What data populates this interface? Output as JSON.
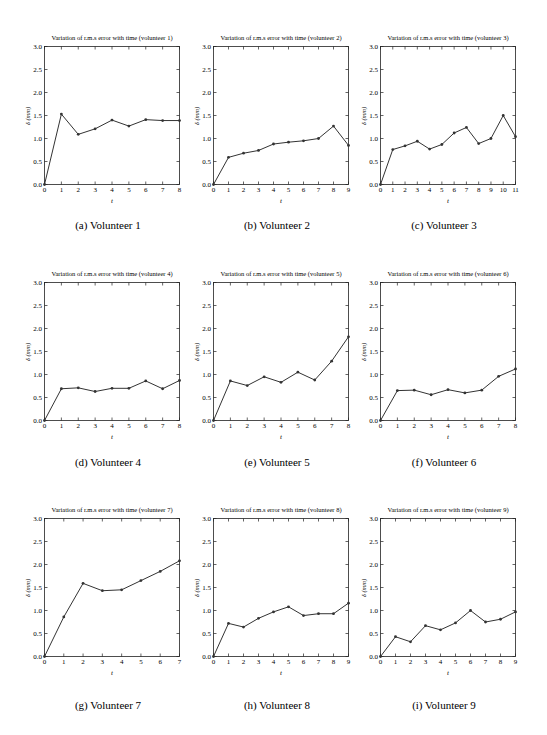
{
  "figure": {
    "panels": [
      {
        "title": "Variation of r.m.s error with time (volunteer 1)",
        "caption": "(a) Volunteer 1",
        "xlabel": "t",
        "ylabel": "δ (mm)"
      },
      {
        "title": "Variation of r.m.s error with time (volunteer 2)",
        "caption": "(b) Volunteer 2",
        "xlabel": "t",
        "ylabel": "δ (mm)"
      },
      {
        "title": "Variation of r.m.s error with time (volunteer 3)",
        "caption": "(c) Volunteer 3",
        "xlabel": "t",
        "ylabel": "δ (mm)"
      },
      {
        "title": "Variation of r.m.s error with time (volunteer 4)",
        "caption": "(d) Volunteer 4",
        "xlabel": "t",
        "ylabel": "δ (mm)"
      },
      {
        "title": "Variation of r.m.s error with time (volunteer 5)",
        "caption": "(e) Volunteer 5",
        "xlabel": "t",
        "ylabel": "δ (mm)"
      },
      {
        "title": "Variation of r.m.s error with time (volunteer 6)",
        "caption": "(f) Volunteer 6",
        "xlabel": "t",
        "ylabel": "δ (mm)"
      },
      {
        "title": "Variation of r.m.s error with time (volunteer 7)",
        "caption": "(g) Volunteer 7",
        "xlabel": "t",
        "ylabel": "δ (mm)"
      },
      {
        "title": "Variation of r.m.s error with time (volunteer 8)",
        "caption": "(h) Volunteer 8",
        "xlabel": "t",
        "ylabel": "δ (mm)"
      },
      {
        "title": "Variation of r.m.s error with time (volunteer 9)",
        "caption": "(i) Volunteer 9",
        "xlabel": "t",
        "ylabel": "δ (mm)"
      }
    ],
    "yticks": [
      "0.0",
      "0.5",
      "1.0",
      "1.5",
      "2.0",
      "2.5",
      "3.0"
    ],
    "line_color": "#333333"
  },
  "chart_data": [
    {
      "type": "line",
      "title": "Variation of r.m.s error with time (volunteer 1)",
      "xlabel": "t",
      "ylabel": "δ (mm)",
      "ylim": [
        0,
        3
      ],
      "xlim": [
        0,
        8
      ],
      "grid": false,
      "x": [
        0,
        1,
        2,
        3,
        4,
        5,
        6,
        7,
        8
      ],
      "values": [
        0.0,
        1.53,
        1.09,
        1.21,
        1.4,
        1.27,
        1.41,
        1.39,
        1.39
      ]
    },
    {
      "type": "line",
      "title": "Variation of r.m.s error with time (volunteer 2)",
      "xlabel": "t",
      "ylabel": "δ (mm)",
      "ylim": [
        0,
        3
      ],
      "xlim": [
        0,
        9
      ],
      "grid": false,
      "x": [
        0,
        1,
        2,
        3,
        4,
        5,
        6,
        7,
        8,
        9
      ],
      "values": [
        0.0,
        0.59,
        0.68,
        0.74,
        0.88,
        0.92,
        0.95,
        1.0,
        1.27,
        0.85
      ]
    },
    {
      "type": "line",
      "title": "Variation of r.m.s error with time (volunteer 3)",
      "xlabel": "t",
      "ylabel": "δ (mm)",
      "ylim": [
        0,
        3
      ],
      "xlim": [
        0,
        11
      ],
      "grid": false,
      "x": [
        0,
        1,
        2,
        3,
        4,
        5,
        6,
        7,
        8,
        9,
        10,
        11
      ],
      "values": [
        0.0,
        0.76,
        0.84,
        0.94,
        0.77,
        0.87,
        1.12,
        1.24,
        0.89,
        1.0,
        1.5,
        1.04
      ]
    },
    {
      "type": "line",
      "title": "Variation of r.m.s error with time (volunteer 4)",
      "xlabel": "t",
      "ylabel": "δ (mm)",
      "ylim": [
        0,
        3
      ],
      "xlim": [
        0,
        8
      ],
      "grid": false,
      "x": [
        0,
        1,
        2,
        3,
        4,
        5,
        6,
        7,
        8
      ],
      "values": [
        0.0,
        0.69,
        0.71,
        0.63,
        0.7,
        0.7,
        0.86,
        0.69,
        0.87
      ]
    },
    {
      "type": "line",
      "title": "Variation of r.m.s error with time (volunteer 5)",
      "xlabel": "t",
      "ylabel": "δ (mm)",
      "ylim": [
        0,
        3
      ],
      "xlim": [
        0,
        8
      ],
      "grid": false,
      "x": [
        0,
        1,
        2,
        3,
        4,
        5,
        6,
        7,
        8
      ],
      "values": [
        0.0,
        0.86,
        0.76,
        0.95,
        0.83,
        1.05,
        0.88,
        1.29,
        1.82
      ]
    },
    {
      "type": "line",
      "title": "Variation of r.m.s error with time (volunteer 6)",
      "xlabel": "t",
      "ylabel": "δ (mm)",
      "ylim": [
        0,
        3
      ],
      "xlim": [
        0,
        8
      ],
      "grid": false,
      "x": [
        0,
        1,
        2,
        3,
        4,
        5,
        6,
        7,
        8
      ],
      "values": [
        0.0,
        0.65,
        0.66,
        0.56,
        0.67,
        0.6,
        0.66,
        0.96,
        1.12
      ]
    },
    {
      "type": "line",
      "title": "Variation of r.m.s error with time (volunteer 7)",
      "xlabel": "t",
      "ylabel": "δ (mm)",
      "ylim": [
        0,
        3
      ],
      "xlim": [
        0,
        7
      ],
      "grid": false,
      "x": [
        0,
        1,
        2,
        3,
        4,
        5,
        6,
        7
      ],
      "values": [
        0.0,
        0.86,
        1.59,
        1.43,
        1.45,
        1.65,
        1.85,
        2.08
      ]
    },
    {
      "type": "line",
      "title": "Variation of r.m.s error with time (volunteer 8)",
      "xlabel": "t",
      "ylabel": "δ (mm)",
      "ylim": [
        0,
        3
      ],
      "xlim": [
        0,
        9
      ],
      "grid": false,
      "x": [
        0,
        1,
        2,
        3,
        4,
        5,
        6,
        7,
        8,
        9
      ],
      "values": [
        0.0,
        0.72,
        0.64,
        0.83,
        0.97,
        1.08,
        0.89,
        0.93,
        0.93,
        1.16
      ]
    },
    {
      "type": "line",
      "title": "Variation of r.m.s error with time (volunteer 9)",
      "xlabel": "t",
      "ylabel": "δ (mm)",
      "ylim": [
        0,
        3
      ],
      "xlim": [
        0,
        9
      ],
      "grid": false,
      "x": [
        0,
        1,
        2,
        3,
        4,
        5,
        6,
        7,
        8,
        9
      ],
      "values": [
        0.0,
        0.43,
        0.32,
        0.67,
        0.58,
        0.73,
        1.0,
        0.75,
        0.81,
        0.97
      ]
    }
  ]
}
